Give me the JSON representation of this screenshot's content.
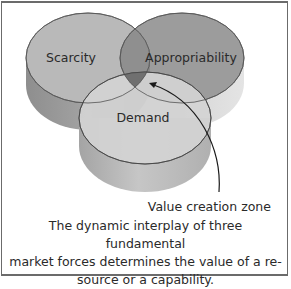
{
  "diagram": {
    "circles": [
      {
        "id": "scarcity",
        "label": "Scarcity",
        "top_color": "#b9b9b9",
        "side_color": "#9a9a9a"
      },
      {
        "id": "appropriability",
        "label": "Appropriability",
        "top_color": "#9c9c9c",
        "side_color": "#d6d6d6"
      },
      {
        "id": "demand",
        "label": "Demand",
        "top_color": "#d3d3d3",
        "side_color": "#b4b4b4"
      }
    ],
    "overlap_color": "#707070",
    "zone_label": "Value creation zone",
    "caption_lines": [
      "The dynamic interplay of three fundamental",
      "market forces determines the value of a re-",
      "source or a capability."
    ],
    "border_color": "#6b6b6b"
  }
}
